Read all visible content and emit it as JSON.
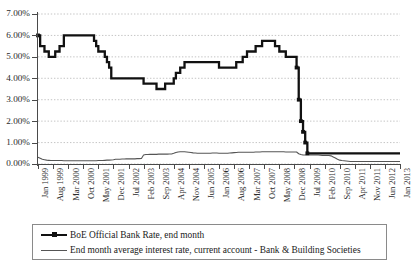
{
  "chart_data": {
    "type": "line",
    "title": "",
    "xlabel": "",
    "ylabel": "",
    "ylim": [
      0,
      7
    ],
    "ytick_labels": [
      "0.00%",
      "1.00%",
      "2.00%",
      "3.00%",
      "4.00%",
      "5.00%",
      "6.00%",
      "7.00%"
    ],
    "ytick_values": [
      0,
      1,
      2,
      3,
      4,
      5,
      6,
      7
    ],
    "grid": true,
    "legend_position": "below-plot",
    "xtick_labels": [
      "Jan 1999",
      "Aug 1999",
      "Mar 2000",
      "Oct 2000",
      "May 2001",
      "Dec 2001",
      "Jul 2002",
      "Feb 2003",
      "Sep 2003",
      "Apr 2004",
      "Nov 2004",
      "Jun 2005",
      "Jan 2006",
      "Aug 2006",
      "Mar 2007",
      "Oct 2007",
      "May 2008",
      "Dec 2008",
      "Jul 2009",
      "Feb 2010",
      "Sep 2010",
      "Apr 2011",
      "Nov 2011",
      "Jun 2012",
      "Jan 2013"
    ],
    "xtick_index": [
      0,
      7,
      14,
      21,
      28,
      35,
      42,
      49,
      56,
      63,
      70,
      77,
      84,
      91,
      98,
      105,
      112,
      119,
      126,
      133,
      140,
      147,
      154,
      161,
      168
    ],
    "x_start": "Jan 1999",
    "x_end": "Jan 2013",
    "n_points": 169,
    "series": [
      {
        "name": "BoE Official Bank Rate, end month",
        "style": "thick-step-with-markers",
        "color": "#111111",
        "values": [
          6.0,
          5.5,
          5.5,
          5.25,
          5.25,
          5.0,
          5.0,
          5.0,
          5.25,
          5.25,
          5.5,
          5.5,
          6.0,
          6.0,
          6.0,
          6.0,
          6.0,
          6.0,
          6.0,
          6.0,
          6.0,
          6.0,
          6.0,
          6.0,
          6.0,
          6.0,
          5.75,
          5.5,
          5.25,
          5.25,
          5.25,
          5.0,
          4.75,
          4.5,
          4.0,
          4.0,
          4.0,
          4.0,
          4.0,
          4.0,
          4.0,
          4.0,
          4.0,
          4.0,
          4.0,
          4.0,
          4.0,
          4.0,
          4.0,
          3.75,
          3.75,
          3.75,
          3.75,
          3.75,
          3.75,
          3.5,
          3.5,
          3.5,
          3.5,
          3.75,
          3.75,
          3.75,
          3.75,
          4.0,
          4.25,
          4.25,
          4.5,
          4.5,
          4.75,
          4.75,
          4.75,
          4.75,
          4.75,
          4.75,
          4.75,
          4.75,
          4.75,
          4.75,
          4.75,
          4.75,
          4.75,
          4.75,
          4.75,
          4.75,
          4.5,
          4.5,
          4.5,
          4.5,
          4.5,
          4.5,
          4.5,
          4.5,
          4.75,
          4.75,
          4.75,
          5.0,
          5.0,
          5.25,
          5.25,
          5.25,
          5.25,
          5.5,
          5.5,
          5.5,
          5.75,
          5.75,
          5.75,
          5.75,
          5.75,
          5.75,
          5.5,
          5.5,
          5.25,
          5.25,
          5.25,
          5.0,
          5.0,
          5.0,
          5.0,
          5.0,
          4.5,
          3.0,
          2.0,
          1.5,
          1.0,
          0.5,
          0.5,
          0.5,
          0.5,
          0.5,
          0.5,
          0.5,
          0.5,
          0.5,
          0.5,
          0.5,
          0.5,
          0.5,
          0.5,
          0.5,
          0.5,
          0.5,
          0.5,
          0.5,
          0.5,
          0.5,
          0.5,
          0.5,
          0.5,
          0.5,
          0.5,
          0.5,
          0.5,
          0.5,
          0.5,
          0.5,
          0.5,
          0.5,
          0.5,
          0.5,
          0.5,
          0.5,
          0.5,
          0.5,
          0.5,
          0.5,
          0.5,
          0.5,
          0.5
        ]
      },
      {
        "name": "End month average interest rate, current account - Bank & Building Societies",
        "style": "thin-line",
        "color": "#555555",
        "values": [
          0.32,
          0.27,
          0.22,
          0.2,
          0.18,
          0.17,
          0.16,
          0.16,
          0.16,
          0.16,
          0.16,
          0.16,
          0.15,
          0.15,
          0.15,
          0.15,
          0.15,
          0.15,
          0.15,
          0.15,
          0.15,
          0.15,
          0.15,
          0.15,
          0.15,
          0.15,
          0.15,
          0.15,
          0.16,
          0.16,
          0.16,
          0.17,
          0.18,
          0.18,
          0.19,
          0.2,
          0.22,
          0.22,
          0.22,
          0.23,
          0.23,
          0.24,
          0.24,
          0.24,
          0.24,
          0.24,
          0.25,
          0.25,
          0.26,
          0.42,
          0.44,
          0.44,
          0.45,
          0.45,
          0.45,
          0.45,
          0.46,
          0.46,
          0.46,
          0.46,
          0.46,
          0.47,
          0.47,
          0.5,
          0.54,
          0.56,
          0.57,
          0.57,
          0.57,
          0.56,
          0.55,
          0.54,
          0.52,
          0.51,
          0.5,
          0.5,
          0.5,
          0.5,
          0.5,
          0.5,
          0.5,
          0.51,
          0.51,
          0.51,
          0.5,
          0.5,
          0.5,
          0.5,
          0.5,
          0.51,
          0.52,
          0.53,
          0.54,
          0.55,
          0.55,
          0.55,
          0.55,
          0.55,
          0.55,
          0.55,
          0.55,
          0.56,
          0.56,
          0.56,
          0.57,
          0.57,
          0.57,
          0.57,
          0.57,
          0.57,
          0.57,
          0.57,
          0.57,
          0.57,
          0.57,
          0.56,
          0.56,
          0.56,
          0.56,
          0.56,
          0.56,
          0.48,
          0.44,
          0.42,
          0.42,
          0.42,
          0.42,
          0.42,
          0.42,
          0.42,
          0.42,
          0.41,
          0.4,
          0.4,
          0.4,
          0.4,
          0.38,
          0.33,
          0.28,
          0.22,
          0.18,
          0.16,
          0.15,
          0.14,
          0.13,
          0.12,
          0.12,
          0.12,
          0.12,
          0.12,
          0.12,
          0.12,
          0.12,
          0.12,
          0.12,
          0.12,
          0.12,
          0.12,
          0.12,
          0.12,
          0.12,
          0.12,
          0.12,
          0.12,
          0.12,
          0.12,
          0.12,
          0.12,
          0.12
        ]
      }
    ],
    "marker_points": [
      {
        "index": 0,
        "value": 6.0
      },
      {
        "index": 120,
        "value": 4.5
      },
      {
        "index": 121,
        "value": 3.0
      },
      {
        "index": 122,
        "value": 2.0
      },
      {
        "index": 123,
        "value": 1.5
      },
      {
        "index": 124,
        "value": 1.0
      },
      {
        "index": 125,
        "value": 0.5
      }
    ]
  },
  "legend": {
    "items": [
      {
        "label": "BoE Official Bank Rate, end month"
      },
      {
        "label": "End month average interest rate, current account - Bank & Building Societies"
      }
    ]
  }
}
